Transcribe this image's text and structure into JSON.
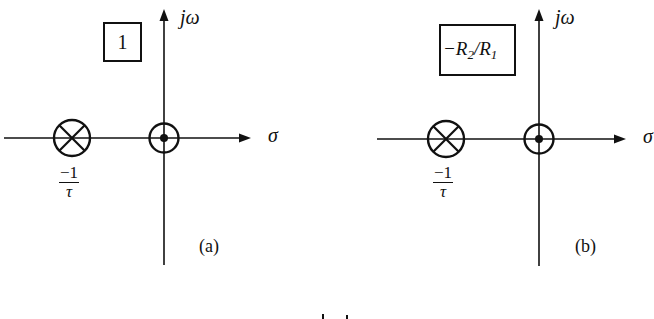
{
  "figure": {
    "panels": [
      {
        "id": "a",
        "caption": "(a)",
        "gain_box": "1",
        "axes": {
          "vertical": "jω",
          "horizontal": "σ"
        },
        "pole": {
          "marker": "circled-x",
          "label_numerator": "−1",
          "label_denominator": "τ"
        },
        "zero": {
          "marker": "circled-dot",
          "location": "origin"
        }
      },
      {
        "id": "b",
        "caption": "(b)",
        "gain_box": {
          "prefix": "−R",
          "sub1": "2",
          "slash": "/R",
          "sub2": "1"
        },
        "axes": {
          "vertical": "jω",
          "horizontal": "σ"
        },
        "pole": {
          "marker": "circled-x",
          "label_numerator": "−1",
          "label_denominator": "τ"
        },
        "zero": {
          "marker": "circled-dot",
          "location": "origin"
        }
      }
    ],
    "bottom_fragment": "A i"
  },
  "colors": {
    "ink": "#111111",
    "background": "#ffffff"
  }
}
